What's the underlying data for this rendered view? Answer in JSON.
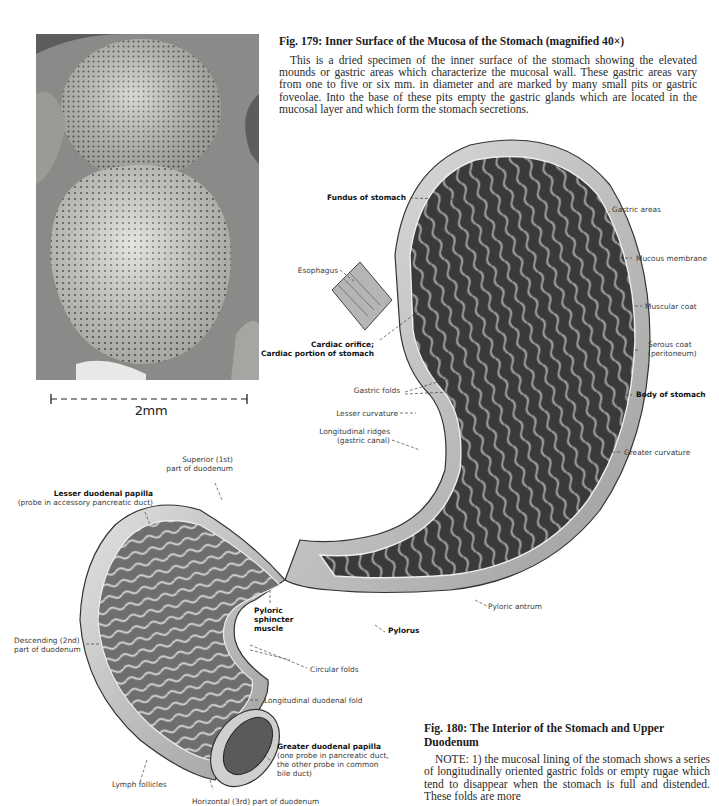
{
  "fig179": {
    "title": "Fig. 179: Inner Surface of the Mucosa of the Stomach (magnified 40×)",
    "body": "This is a dried specimen of the inner surface of the stomach showing the elevated mounds or gastric areas which characterize the mucosal wall. These gastric areas vary from one to five or six mm. in diameter and are marked by many small pits or gastric foveolae. Into the base of these pits empty the gastric glands which are located in the mucosal layer and which form the stomach secretions.",
    "scale_label": "2mm"
  },
  "fig180": {
    "title": "Fig. 180: The Interior of the Stomach and Upper Duodenum",
    "body": "NOTE: 1) the mucosal lining of the stomach shows a series of longitudinally oriented gastric folds or empty rugae which tend to disappear when the stomach is full and distended. These folds are more",
    "labels": {
      "fundus": "Fundus of stomach",
      "gastric_areas": "Gastric areas",
      "esophagus": "Esophagus",
      "mucous_membrane": "Mucous membrane",
      "muscular_coat": "Muscular coat",
      "cardiac_1": "Cardiac orifice;",
      "cardiac_2": "Cardiac portion of stomach",
      "serous_1": "Serous coat",
      "serous_2": "(peritoneum)",
      "gastric_folds": "Gastric folds",
      "body": "Body of stomach",
      "lesser_curvature": "Lesser curvature",
      "long_ridges_1": "Longitudinal ridges",
      "long_ridges_2": "(gastric canal)",
      "greater_curvature": "Greater curvature",
      "superior_1": "Superior (1st)",
      "superior_2": "part of duodenum",
      "lesser_papilla_1": "Lesser duodenal papilla",
      "lesser_papilla_2": "(probe in accessory pancreatic duct)",
      "pyloric_antrum": "Pyloric antrum",
      "pyloric_sphincter_1": "Pyloric",
      "pyloric_sphincter_2": "sphincter",
      "pyloric_sphincter_3": "muscle",
      "pylorus": "Pylorus",
      "descending_1": "Descending (2nd)",
      "descending_2": "part of duodenum",
      "circular_folds": "Circular folds",
      "long_duodenal_fold": "Longitudinal duodenal fold",
      "greater_papilla_1": "Greater duodenal papilla",
      "greater_papilla_2": "(one probe in pancreatic duct,",
      "greater_papilla_3": "the other probe in common",
      "greater_papilla_4": "bile duct)",
      "lymph_follicles": "Lymph follicles",
      "horizontal_cut": "Horizontal (3rd) part of duodenum"
    }
  }
}
